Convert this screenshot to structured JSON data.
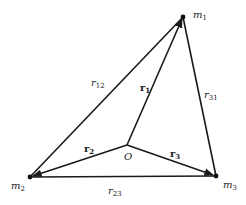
{
  "diagram": {
    "colors": {
      "line": "#1a1a1a",
      "text": "#222222",
      "background": "#ffffff"
    },
    "points": {
      "m1": {
        "label": "m",
        "sub": "1",
        "x": 183,
        "y": 17
      },
      "m2": {
        "label": "m",
        "sub": "2",
        "x": 30,
        "y": 177
      },
      "m3": {
        "label": "m",
        "sub": "3",
        "x": 216,
        "y": 176
      },
      "O": {
        "label": "O",
        "x": 127,
        "y": 145
      }
    },
    "edges": [
      {
        "from": "m1",
        "to": "m2",
        "label": "r",
        "sub": "12"
      },
      {
        "from": "m2",
        "to": "m3",
        "label": "r",
        "sub": "23"
      },
      {
        "from": "m3",
        "to": "m1",
        "label": "r",
        "sub": "31"
      }
    ],
    "vectors": [
      {
        "from": "O",
        "to": "m1",
        "label": "r",
        "sub": "1",
        "bold": true
      },
      {
        "from": "O",
        "to": "m2",
        "label": "r",
        "sub": "2",
        "bold": true
      },
      {
        "from": "O",
        "to": "m3",
        "label": "r",
        "sub": "3",
        "bold": true
      }
    ],
    "labels": {
      "m1": "m",
      "m1_sub": "1",
      "m2": "m",
      "m2_sub": "2",
      "m3": "m",
      "m3_sub": "3",
      "O": "O",
      "r12": "r",
      "r12_sub": "12",
      "r23": "r",
      "r23_sub": "23",
      "r31": "r",
      "r31_sub": "31",
      "r1": "r",
      "r1_sub": "1",
      "r2": "r",
      "r2_sub": "2",
      "r3": "r",
      "r3_sub": "3"
    }
  }
}
